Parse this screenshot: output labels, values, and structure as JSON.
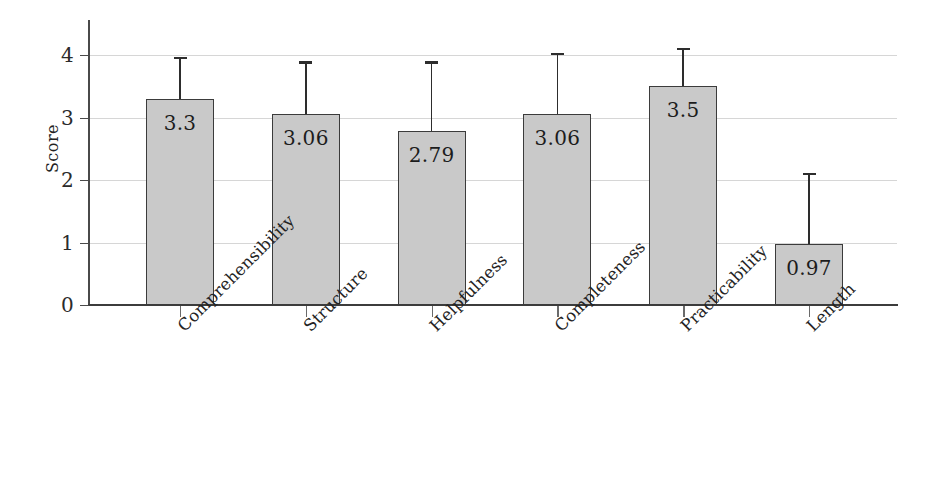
{
  "chart_data": {
    "type": "bar",
    "title": "",
    "subtitle": "",
    "xlabel": "",
    "ylabel": "Score",
    "categories": [
      "Comprehensibility",
      "Structure",
      "Helpfulness",
      "Completeness",
      "Practicability",
      "Length"
    ],
    "values": [
      3.3,
      3.06,
      2.79,
      3.06,
      3.5,
      0.97
    ],
    "value_labels": [
      "3.3",
      "3.06",
      "2.79",
      "3.06",
      "3.5",
      "0.97"
    ],
    "error_upper": [
      0.67,
      0.84,
      1.11,
      0.98,
      0.62,
      1.15
    ],
    "error_top_values": [
      3.97,
      3.9,
      3.9,
      4.04,
      4.12,
      2.12
    ],
    "ylim": [
      0,
      4.55
    ],
    "yticks": [
      0,
      1,
      2,
      3,
      4
    ],
    "ytick_labels": [
      "0",
      "1",
      "2",
      "3",
      "4"
    ],
    "grid": true,
    "grid_axis": "y",
    "legend": "none",
    "legend_position": "none",
    "bar_fill_color": "#c9c9c9",
    "bar_edge_color": "#3b3b3b",
    "error_bar_color": "#2d2d2d",
    "gridline_color": "#d6d6d6",
    "axis_color": "#3c3c3c",
    "background_color": "#ffffff",
    "xtick_label_rotation": -45
  }
}
